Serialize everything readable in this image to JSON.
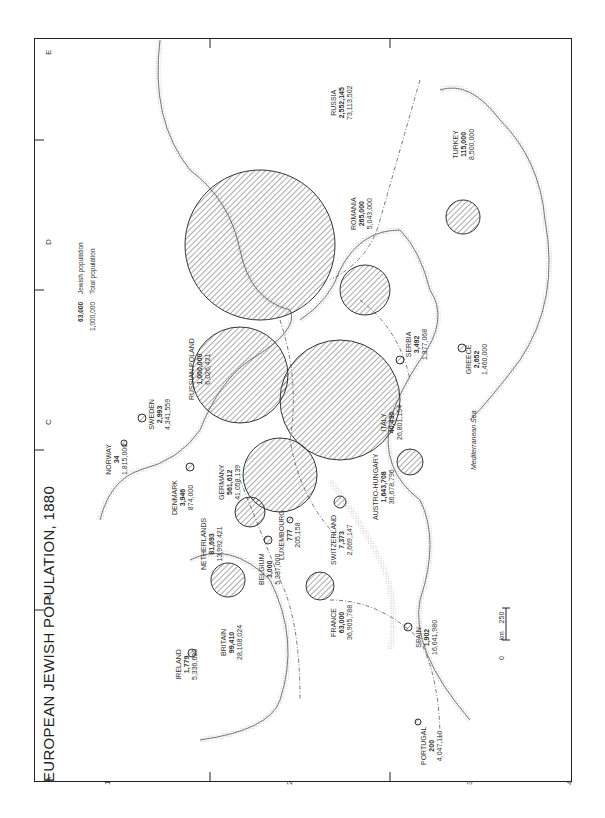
{
  "title": "EUROPEAN JEWISH POPULATION, 1880",
  "legend": {
    "jewish_value": "63,000",
    "jewish_label": "Jewish population",
    "total_value": "1,000,000",
    "total_label": "Total population"
  },
  "scale": {
    "zero": "0",
    "max": "250",
    "unit": "km"
  },
  "grid": {
    "columns": [
      "A",
      "B",
      "C",
      "D",
      "E"
    ],
    "rows": [
      "1",
      "2",
      "3",
      "4"
    ]
  },
  "sea_label": "Mediterranean Sea",
  "countries": [
    {
      "name": "RUSSIA",
      "jewish": "2,552,145",
      "total": "73,113,502"
    },
    {
      "name": "AUSTRO-HUNGARY",
      "jewish": "1,643,708",
      "total": "36,678,796"
    },
    {
      "name": "RUSSIAN POLAND",
      "jewish": "1,000,000",
      "total": "6,026,421"
    },
    {
      "name": "GERMANY",
      "jewish": "561,612",
      "total": "41,058,139"
    },
    {
      "name": "ROMANIA",
      "jewish": "265,000",
      "total": "5,043,000"
    },
    {
      "name": "TURKEY",
      "jewish": "115,000",
      "total": "8,500,000"
    },
    {
      "name": "BRITAIN",
      "jewish": "99,410",
      "total": "28,108,024"
    },
    {
      "name": "NETHERLANDS",
      "jewish": "81,693",
      "total": "13,992,421"
    },
    {
      "name": "FRANCE",
      "jewish": "63,000",
      "total": "36,905,788"
    },
    {
      "name": "ITALY",
      "jewish": "40,430",
      "total": "26,801,154"
    },
    {
      "name": "SWITZERLAND",
      "jewish": "7,373",
      "total": "2,669,147"
    },
    {
      "name": "DENMARK",
      "jewish": "3,946",
      "total": "874,000"
    },
    {
      "name": "SERBIA",
      "jewish": "3,492",
      "total": "1,377,068"
    },
    {
      "name": "BELGIUM",
      "jewish": "3,000",
      "total": "5,337,000"
    },
    {
      "name": "SWEDEN",
      "jewish": "2,993",
      "total": "4,341,559"
    },
    {
      "name": "GREECE",
      "jewish": "2,652",
      "total": "1,460,000"
    },
    {
      "name": "SPAIN",
      "jewish": "1,902",
      "total": "16,641,980"
    },
    {
      "name": "IRELAND",
      "jewish": "1,779",
      "total": "5,336,630"
    },
    {
      "name": "LUXEMBOURG",
      "jewish": "777",
      "total": "205,158"
    },
    {
      "name": "PORTUGAL",
      "jewish": "200",
      "total": "4,047,110"
    },
    {
      "name": "NORWAY",
      "jewish": "34",
      "total": "1,815,000"
    }
  ]
}
